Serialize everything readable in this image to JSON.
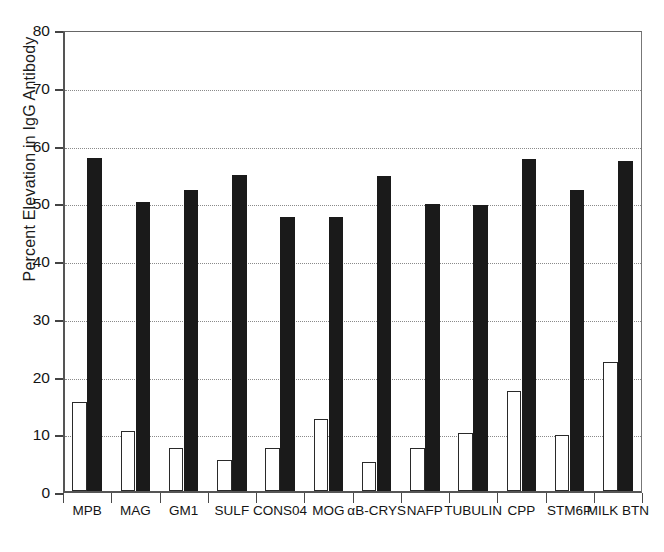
{
  "chart_data": {
    "type": "bar",
    "title": "",
    "xlabel": "",
    "ylabel": "Percent Elevation in IgG Antibody",
    "ylim": [
      0,
      80
    ],
    "yticks": [
      0,
      10,
      20,
      30,
      40,
      50,
      60,
      70,
      80
    ],
    "grid": "horizontal-dotted",
    "legend": "none",
    "categories": [
      "MPB",
      "MAG",
      "GM1",
      "SULF",
      "CONS04",
      "MOG",
      "αB-CRYS",
      "NAFP",
      "TUBULIN",
      "CPP",
      "STM6P",
      "MILK BTN"
    ],
    "series": [
      {
        "name": "open",
        "style": "white-bar-black-outline",
        "color": "#ffffff",
        "values": [
          15.4,
          10.4,
          7.5,
          5.4,
          7.5,
          12.4,
          5.1,
          7.4,
          10.0,
          17.4,
          9.7,
          22.3
        ]
      },
      {
        "name": "filled",
        "style": "solid-black-bar",
        "color": "#1a1a1a",
        "values": [
          57.7,
          50.1,
          52.2,
          54.8,
          47.5,
          47.5,
          54.5,
          49.7,
          49.5,
          57.5,
          52.2,
          57.1
        ]
      }
    ]
  }
}
